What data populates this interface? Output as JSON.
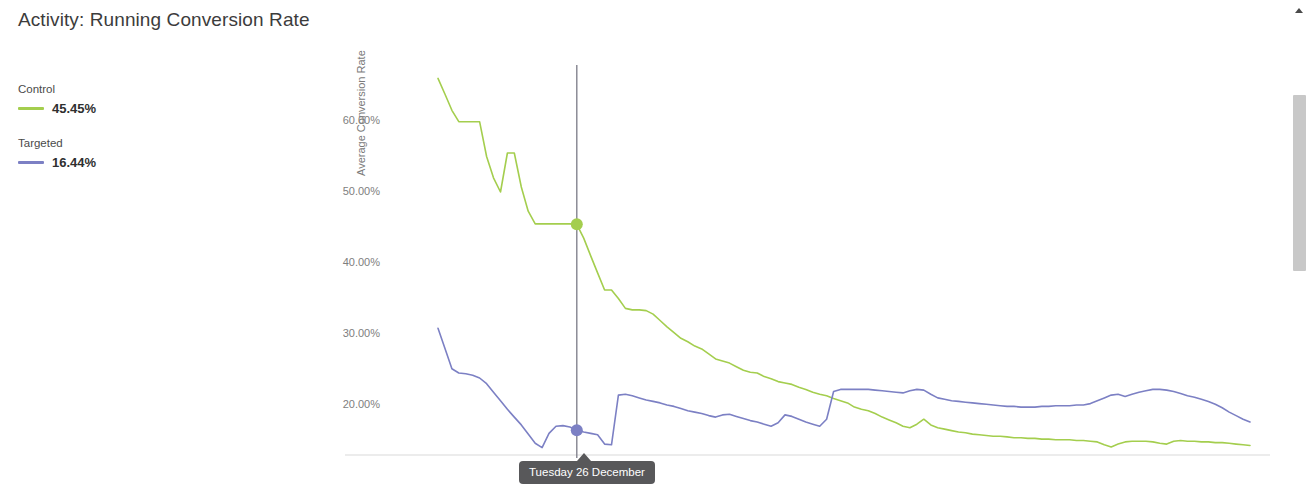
{
  "panel": {
    "title": "Activity: Running Conversion Rate"
  },
  "legend": [
    {
      "name": "Control",
      "value": "45.45%",
      "color": "#a4ce4e"
    },
    {
      "name": "Targeted",
      "value": "16.44%",
      "color": "#7c80c4"
    }
  ],
  "tooltip": {
    "label": "Tuesday 26 December"
  },
  "scrollbar": {
    "up_arrow": "scroll-up-arrow"
  },
  "chart_data": {
    "type": "line",
    "title": "Activity: Running Conversion Rate",
    "xlabel": "",
    "ylabel": "Average Conversion Rate",
    "ylim": [
      13,
      68
    ],
    "yticks": [
      20,
      30,
      40,
      50,
      60
    ],
    "ytick_labels": [
      "20.00%",
      "30.00%",
      "40.00%",
      "50.00%",
      "60.00%"
    ],
    "grid": false,
    "legend_position": "left-outside",
    "x": [
      0,
      1,
      2,
      3,
      4,
      5,
      6,
      7,
      8,
      9,
      10,
      11,
      12,
      13,
      14,
      15,
      16,
      17,
      18,
      19,
      20,
      21,
      22,
      23,
      24,
      25,
      26,
      27,
      28,
      29,
      30,
      31,
      32,
      33,
      34,
      35,
      36,
      37,
      38,
      39,
      40,
      41,
      42,
      43,
      44,
      45,
      46,
      47,
      48,
      49,
      50,
      51,
      52,
      53,
      54,
      55,
      56,
      57,
      58,
      59,
      60,
      61,
      62,
      63,
      64,
      65,
      66,
      67,
      68,
      69,
      70,
      71,
      72,
      73,
      74,
      75,
      76,
      77,
      78,
      79,
      80,
      81,
      82,
      83,
      84,
      85,
      86,
      87,
      88,
      89,
      90,
      91,
      92,
      93,
      94,
      95,
      96,
      97,
      98,
      99,
      100,
      101,
      102,
      103,
      104,
      105,
      106,
      107,
      108,
      109,
      110,
      111,
      112,
      113,
      114,
      115,
      116,
      117
    ],
    "highlight": {
      "x_index": 20,
      "x_label": "Tuesday 26 December",
      "control_value": 45.45,
      "targeted_value": 16.44
    },
    "series": [
      {
        "name": "Control",
        "color": "#a4ce4e",
        "values": [
          66.0,
          63.8,
          61.5,
          59.9,
          59.9,
          59.9,
          59.9,
          55.0,
          52.0,
          50.0,
          55.5,
          55.5,
          50.7,
          47.3,
          45.5,
          45.5,
          45.5,
          45.5,
          45.5,
          45.5,
          45.45,
          43.5,
          41.0,
          38.6,
          36.2,
          36.2,
          35.0,
          33.6,
          33.4,
          33.4,
          33.3,
          32.8,
          31.9,
          31.0,
          30.2,
          29.4,
          28.9,
          28.3,
          27.9,
          27.2,
          26.5,
          26.2,
          25.9,
          25.4,
          24.9,
          24.6,
          24.5,
          24.0,
          23.7,
          23.3,
          23.1,
          22.9,
          22.5,
          22.2,
          21.8,
          21.5,
          21.3,
          20.9,
          20.6,
          20.3,
          19.7,
          19.4,
          19.2,
          18.8,
          18.3,
          17.9,
          17.5,
          17.0,
          16.8,
          17.3,
          18.0,
          17.2,
          16.8,
          16.6,
          16.4,
          16.2,
          16.1,
          15.9,
          15.8,
          15.7,
          15.6,
          15.6,
          15.5,
          15.4,
          15.4,
          15.3,
          15.3,
          15.2,
          15.2,
          15.1,
          15.1,
          15.1,
          15.0,
          15.0,
          14.9,
          14.8,
          14.4,
          14.1,
          14.5,
          14.8,
          14.9,
          14.9,
          14.9,
          14.8,
          14.6,
          14.5,
          14.9,
          15.0,
          14.9,
          14.9,
          14.8,
          14.8,
          14.7,
          14.7,
          14.6,
          14.5,
          14.4,
          14.3
        ]
      },
      {
        "name": "Targeted",
        "color": "#7c80c4",
        "values": [
          30.8,
          28.0,
          25.1,
          24.5,
          24.4,
          24.2,
          23.8,
          23.0,
          21.8,
          20.6,
          19.4,
          18.3,
          17.2,
          15.9,
          14.6,
          14.0,
          16.0,
          17.0,
          17.1,
          16.9,
          16.44,
          16.2,
          16.0,
          15.8,
          14.5,
          14.4,
          21.4,
          21.5,
          21.3,
          21.0,
          20.7,
          20.5,
          20.3,
          20.0,
          19.8,
          19.5,
          19.2,
          19.0,
          18.8,
          18.5,
          18.3,
          18.6,
          18.7,
          18.4,
          18.1,
          17.8,
          17.6,
          17.3,
          17.0,
          17.5,
          18.6,
          18.4,
          18.0,
          17.6,
          17.3,
          17.0,
          18.0,
          21.9,
          22.2,
          22.2,
          22.2,
          22.2,
          22.2,
          22.1,
          22.0,
          21.9,
          21.8,
          21.7,
          22.0,
          22.2,
          22.1,
          21.5,
          21.0,
          20.8,
          20.6,
          20.5,
          20.4,
          20.3,
          20.2,
          20.1,
          20.0,
          19.9,
          19.8,
          19.8,
          19.7,
          19.7,
          19.7,
          19.8,
          19.8,
          19.9,
          19.9,
          19.9,
          20.0,
          20.0,
          20.2,
          20.6,
          21.0,
          21.4,
          21.5,
          21.2,
          21.5,
          21.8,
          22.0,
          22.2,
          22.2,
          22.1,
          21.9,
          21.6,
          21.3,
          21.1,
          20.8,
          20.5,
          20.1,
          19.6,
          19.0,
          18.5,
          18.0,
          17.6
        ]
      }
    ]
  }
}
